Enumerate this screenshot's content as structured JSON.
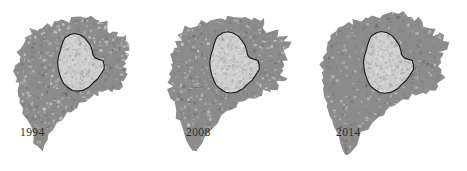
{
  "figure": {
    "type": "map-series",
    "panel_count": 3,
    "background_color": "#ffffff",
    "label_color": "#2b2b2b"
  },
  "legend_colors": {
    "urban_extent_fill": "#8c8c8c",
    "urban_extent_speckle_light": "#c9c9c9",
    "urban_extent_speckle_dark": "#6e6e6e",
    "core_polygon_fill": "#cfcfcf",
    "core_polygon_stroke": "#1d1d1d",
    "background": "#ffffff"
  },
  "panels": [
    {
      "id": "panel-1994",
      "year_label": "1994",
      "label_x": 20,
      "label_y": 126,
      "panel_x": 0,
      "urban_seed": 11,
      "urban_density": 0.46,
      "urban_scale": 0.915,
      "core_seed": 31,
      "core_scale": 0.93,
      "core_shift_x": 2.5,
      "core_shift_y": 0
    },
    {
      "id": "panel-2008",
      "year_label": "2008",
      "label_x": 186,
      "label_y": 126,
      "panel_x": 156,
      "urban_seed": 27,
      "urban_density": 0.62,
      "urban_scale": 0.96,
      "core_seed": 31,
      "core_scale": 0.99,
      "core_shift_x": 0,
      "core_shift_y": 0
    },
    {
      "id": "panel-2014",
      "year_label": "2014",
      "label_x": 336,
      "label_y": 126,
      "panel_x": 311,
      "urban_seed": 44,
      "urban_density": 0.76,
      "urban_scale": 1.0,
      "core_seed": 31,
      "core_scale": 1.0,
      "core_shift_x": -1.0,
      "core_shift_y": 0
    }
  ],
  "geometry": {
    "urban_outline_path": "M 74 14 L 80 13 L 86 15 L 91 13 L 96 16 L 100 15 L 104 19 L 109 18 L 112 22 L 110 27 L 114 29 L 119 27 L 123 30 L 121 35 L 126 36 L 129 33 L 133 36 L 131 41 L 136 43 L 134 48 L 130 50 L 134 53 L 132 58 L 127 59 L 130 63 L 127 67 L 131 70 L 128 74 L 132 77 L 129 82 L 124 83 L 127 87 L 123 90 L 118 89 L 115 93 L 110 92 L 107 96 L 103 95 L 99 99 L 94 98 L 90 102 L 85 103 L 81 108 L 76 110 L 72 115 L 67 119 L 62 124 L 57 129 L 52 134 L 48 140 L 44 146 L 41 152 L 38 157 L 34 153 L 31 148 L 29 142 L 27 136 L 25 130 L 22 125 L 19 120 L 17 114 L 15 108 L 14 102 L 12 97 L 11 91 L 13 86 L 10 82 L 12 77 L 9 73 L 12 69 L 10 64 L 14 61 L 12 56 L 16 53 L 14 48 L 18 45 L 17 40 L 22 38 L 21 33 L 26 31 L 28 26 L 33 27 L 36 23 L 41 24 L 44 20 L 49 21 L 53 18 L 58 19 L 62 15 L 68 16 Z",
    "core_outline_path": "M 62 36 L 67 33 L 72 32 L 77 33 L 82 36 L 86 40 L 89 45 L 91 50 L 92 55 L 94 58 L 98 59 L 102 61 L 104 65 L 103 70 L 100 75 L 96 80 L 92 85 L 87 89 L 81 92 L 75 93 L 69 92 L 64 89 L 60 85 L 57 80 L 55 74 L 54 68 L 54 62 L 55 56 L 56 50 L 58 44 L 60 39 Z"
  },
  "year_labels": [
    "1994",
    "2008",
    "2014"
  ]
}
